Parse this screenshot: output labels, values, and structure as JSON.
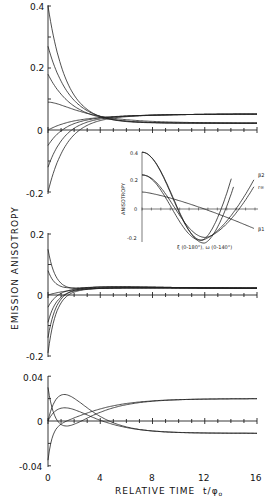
{
  "chart_data": [
    {
      "type": "line",
      "panel": "top",
      "title": "",
      "xlabel": "RELATIVE TIME t/φ0",
      "ylabel": "EMISSION ANISOTROPY",
      "xlim": [
        0,
        16
      ],
      "ylim": [
        -0.2,
        0.4
      ],
      "yticks": [
        "0.4",
        "0.2",
        "0",
        "-0.2"
      ],
      "limiting_value": 0.022,
      "series": [
        {
          "name": "r0=0.40",
          "r0": 0.4,
          "decay": 1.0
        },
        {
          "name": "r0=0.27",
          "r0": 0.27,
          "decay": 1.1
        },
        {
          "name": "r0=0.18",
          "r0": 0.18,
          "decay": 1.3
        },
        {
          "name": "r0=0.09",
          "r0": 0.09,
          "decay": 2.6,
          "hump": true
        },
        {
          "name": "r0=0.0",
          "r0": 0.0,
          "decay": 1.0
        },
        {
          "name": "r0=-0.05",
          "r0": -0.05,
          "decay": 1.0
        },
        {
          "name": "r0=-0.12",
          "r0": -0.12,
          "decay": 1.0
        },
        {
          "name": "r0=-0.20",
          "r0": -0.2,
          "decay": 1.1
        }
      ]
    },
    {
      "type": "line",
      "panel": "inset",
      "ylabel": "ANISOTROPY",
      "xlabel": "ξ (0-180°),  ω (0-140°)",
      "ylim": [
        -0.2,
        0.4
      ],
      "yticks": [
        "0.4",
        "0.2",
        "0",
        "-0.2"
      ],
      "legend": [
        "β2",
        "r∞",
        "β1"
      ],
      "series": [
        {
          "name": "curve-a",
          "y0": 0.4,
          "min": -0.22,
          "end": 0.24
        },
        {
          "name": "curve-b",
          "y0": 0.4,
          "min": -0.24,
          "end": 0.18
        },
        {
          "name": "β2",
          "y0": 0.24,
          "min": -0.22,
          "end": 0.22
        },
        {
          "name": "r∞",
          "y0": 0.24,
          "min": -0.2,
          "end": 0.17
        },
        {
          "name": "β1",
          "y0": 0.12,
          "min": -0.12,
          "end": -0.12
        }
      ]
    },
    {
      "type": "line",
      "panel": "middle",
      "xlim": [
        0,
        16
      ],
      "ylim": [
        -0.2,
        0.2
      ],
      "yticks": [
        "0.2",
        "0",
        "-0.2"
      ],
      "limiting_value": 0.022,
      "series": [
        {
          "name": "r0=0.15",
          "r0": 0.15
        },
        {
          "name": "r0=0.08",
          "r0": 0.08
        },
        {
          "name": "r0=0.0",
          "r0": 0.0
        },
        {
          "name": "r0=-0.04",
          "r0": -0.04
        },
        {
          "name": "r0=-0.09",
          "r0": -0.09
        },
        {
          "name": "r0=-0.14",
          "r0": -0.14
        },
        {
          "name": "r0=-0.19",
          "r0": -0.19
        }
      ]
    },
    {
      "type": "line",
      "panel": "bottom",
      "xlim": [
        0,
        16
      ],
      "ylim": [
        -0.04,
        0.04
      ],
      "xticks": [
        "0",
        "4",
        "8",
        "12",
        "16"
      ],
      "yticks": [
        "0.04",
        "0",
        "-0.04"
      ],
      "series": [
        {
          "name": "peak-high",
          "start": 0.0,
          "peak": 0.027,
          "end": -0.011
        },
        {
          "name": "peak-mid",
          "start": 0.0,
          "peak": 0.015,
          "end": -0.011
        },
        {
          "name": "dip-rise",
          "start": 0.03,
          "min": -0.012,
          "end": 0.02
        },
        {
          "name": "neg-rise",
          "start": -0.035,
          "min": -0.008,
          "end": 0.02
        }
      ]
    }
  ],
  "labels": {
    "ylabel": "EMISSION ANISOTROPY",
    "xlabel_main": "RELATIVE TIME",
    "xlabel_var": "t/φ",
    "xlabel_sub": "o",
    "top_yticks": [
      "0.4",
      "0.2",
      "0",
      "-0.2"
    ],
    "mid_yticks": [
      "0.2",
      "0",
      "-0.2"
    ],
    "bot_yticks": [
      "0.04",
      "0",
      "-0.04"
    ],
    "xticks": [
      "0",
      "4",
      "8",
      "12",
      "16"
    ],
    "inset_ylabel": "ANISOTROPY",
    "inset_yticks": [
      "0.4",
      "0.2",
      "0",
      "-0.2"
    ],
    "inset_xlabel": "ξ (0-180°),   ω (0-140°)",
    "inset_legend": [
      "β2",
      "r∞",
      "β1"
    ]
  }
}
